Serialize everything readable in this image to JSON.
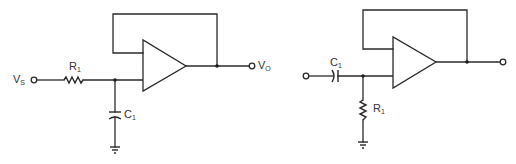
{
  "figure": {
    "colors": {
      "line": "#2a2a2a",
      "background": "#ffffff",
      "text": "#333333"
    }
  },
  "left_circuit": {
    "type": "low-pass",
    "input_label": {
      "main": "V",
      "sub": "S"
    },
    "output_label": {
      "main": "V",
      "sub": "O"
    },
    "resistor_label": {
      "main": "R",
      "sub": "1"
    },
    "capacitor_label": {
      "main": "C",
      "sub": "1"
    },
    "components": [
      "input-terminal",
      "R1 series",
      "C1 shunt to ground",
      "op-amp voltage follower",
      "output-terminal"
    ]
  },
  "right_circuit": {
    "type": "high-pass",
    "capacitor_label": {
      "main": "C",
      "sub": "1"
    },
    "resistor_label": {
      "main": "R",
      "sub": "1"
    },
    "components": [
      "input-terminal",
      "C1 series",
      "R1 shunt to ground",
      "op-amp voltage follower",
      "output-terminal"
    ]
  }
}
